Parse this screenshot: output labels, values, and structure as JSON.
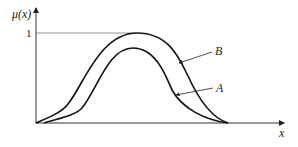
{
  "diagram": {
    "y_axis_label": "μ(x)",
    "x_axis_label": "x",
    "y_tick_label": "1",
    "curves": [
      {
        "name": "A",
        "label": "A",
        "description": "inner bell-shaped membership curve, peak below 1"
      },
      {
        "name": "B",
        "label": "B",
        "description": "outer bell-shaped membership curve, peak at 1"
      }
    ],
    "colors": {
      "line": "#222222",
      "axis": "#333333",
      "reference_line": "#777777",
      "background": "#ffffff"
    }
  }
}
